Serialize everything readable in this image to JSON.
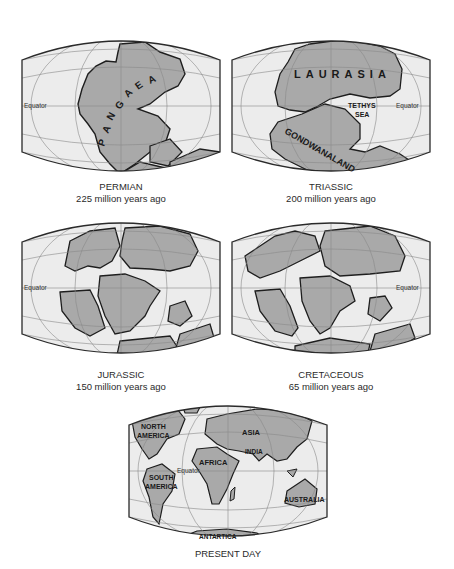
{
  "figure": {
    "colors": {
      "ocean": "#ececec",
      "land": "#a9a9a9",
      "coastline": "#1e1e1e",
      "gridlines": "#8a8a8a",
      "frame": "#2a2a2a",
      "caption_text": "#2a2a2a"
    },
    "equator_label": "Equator",
    "panels": [
      {
        "id": "permian",
        "period": "PERMIAN",
        "age": "225 million years ago",
        "labels": [
          "PANGAEA"
        ],
        "letters": [
          "P",
          "A",
          "N",
          "G",
          "A",
          "E",
          "A"
        ]
      },
      {
        "id": "triassic",
        "period": "TRIASSIC",
        "age": "200 million years ago",
        "labels": [
          "LAURASIA",
          "TETHYS",
          "SEA",
          "GONDWANALAND"
        ]
      },
      {
        "id": "jurassic",
        "period": "JURASSIC",
        "age": "150 million years ago",
        "labels": []
      },
      {
        "id": "cretaceous",
        "period": "CRETACEOUS",
        "age": "65 million years ago",
        "labels": []
      },
      {
        "id": "present",
        "period": "PRESENT DAY",
        "age": "",
        "labels": [
          "NORTH",
          "AMERICA",
          "SOUTH",
          "AMERICA",
          "AFRICA",
          "ASIA",
          "INDIA",
          "AUSTRALIA",
          "ANTARTICA"
        ]
      }
    ]
  }
}
